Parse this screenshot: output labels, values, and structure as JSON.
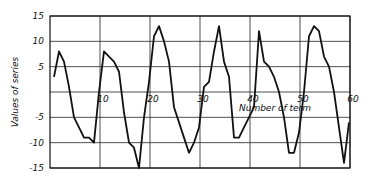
{
  "chart_data": {
    "type": "line",
    "title": "",
    "xlabel": "Number of term",
    "ylabel": "Values of series",
    "xlim": [
      0,
      60
    ],
    "ylim": [
      -15,
      15
    ],
    "grid": true,
    "legend": "none",
    "x_ticks": [
      10,
      20,
      30,
      40,
      50,
      60
    ],
    "x_tick_labels": [
      "10",
      "20",
      "30",
      "40",
      "50",
      "60"
    ],
    "y_ticks": [
      15,
      10,
      5,
      -5,
      -10,
      -15
    ],
    "y_tick_labels": [
      "15",
      "10",
      "5",
      "-5",
      "-10",
      "-15"
    ],
    "series": [
      {
        "name": "Values of series",
        "x": [
          1,
          2,
          3,
          4,
          5,
          6,
          7,
          8,
          9,
          10,
          11,
          12,
          13,
          14,
          15,
          16,
          17,
          18,
          19,
          20,
          21,
          22,
          23,
          24,
          25,
          26,
          27,
          28,
          29,
          30,
          31,
          32,
          33,
          34,
          35,
          36,
          37,
          38,
          39,
          40,
          41,
          42,
          43,
          44,
          45,
          46,
          47,
          48,
          49,
          50,
          51,
          52,
          53,
          54,
          55,
          56,
          57,
          58,
          59,
          60
        ],
        "values": [
          3,
          8,
          6,
          1,
          -5,
          -7,
          -9,
          -9,
          -10,
          0,
          8,
          7,
          6,
          4,
          -4,
          -10,
          -11,
          -15,
          -5,
          2,
          11,
          13,
          10,
          6,
          -3,
          -6,
          -9,
          -12,
          -10,
          -7,
          1,
          2,
          8,
          13,
          6,
          3,
          -9,
          -9,
          -7,
          -5,
          -3,
          12,
          6,
          5,
          3,
          0,
          -5,
          -12,
          -12,
          -8,
          0,
          11,
          13,
          12,
          7,
          5,
          0,
          -7,
          -14,
          -6
        ]
      }
    ]
  }
}
